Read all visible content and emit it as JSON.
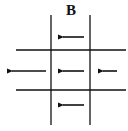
{
  "figure": {
    "panel_label": "B",
    "line_color": "#111111",
    "background": "#ffffff",
    "grid": {
      "rows": 3,
      "cols": 3
    },
    "arrows": [
      {
        "id": "top-center",
        "row": 0,
        "col": 1,
        "direction": "left",
        "length": "medium"
      },
      {
        "id": "middle-left",
        "row": 1,
        "col": 0,
        "direction": "left",
        "length": "long"
      },
      {
        "id": "middle-center",
        "row": 1,
        "col": 1,
        "direction": "left",
        "length": "medium"
      },
      {
        "id": "middle-right",
        "row": 1,
        "col": 2,
        "direction": "left",
        "length": "short"
      },
      {
        "id": "bottom-center",
        "row": 2,
        "col": 1,
        "direction": "left",
        "length": "medium"
      }
    ],
    "caption_fragment": ""
  }
}
